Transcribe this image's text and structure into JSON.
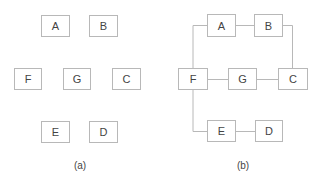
{
  "panels": [
    {
      "caption": "(a)",
      "nodes": [
        {
          "id": "A",
          "label": "A",
          "x": 41,
          "y": 15,
          "w": 29,
          "h": 22
        },
        {
          "id": "B",
          "label": "B",
          "x": 89,
          "y": 15,
          "w": 29,
          "h": 22
        },
        {
          "id": "F",
          "label": "F",
          "x": 14,
          "y": 68,
          "w": 28,
          "h": 22
        },
        {
          "id": "G",
          "label": "G",
          "x": 63,
          "y": 68,
          "w": 28,
          "h": 22
        },
        {
          "id": "C",
          "label": "C",
          "x": 112,
          "y": 68,
          "w": 29,
          "h": 22
        },
        {
          "id": "E",
          "label": "E",
          "x": 41,
          "y": 121,
          "w": 29,
          "h": 22
        },
        {
          "id": "D",
          "label": "D",
          "x": 89,
          "y": 121,
          "w": 29,
          "h": 22
        }
      ],
      "edges": []
    },
    {
      "caption": "(b)",
      "nodes": [
        {
          "id": "A",
          "label": "A",
          "x": 207,
          "y": 14,
          "w": 29,
          "h": 23
        },
        {
          "id": "B",
          "label": "B",
          "x": 254,
          "y": 14,
          "w": 29,
          "h": 23
        },
        {
          "id": "F",
          "label": "F",
          "x": 178,
          "y": 68,
          "w": 30,
          "h": 22
        },
        {
          "id": "G",
          "label": "G",
          "x": 228,
          "y": 68,
          "w": 29,
          "h": 22
        },
        {
          "id": "C",
          "label": "C",
          "x": 278,
          "y": 68,
          "w": 30,
          "h": 22
        },
        {
          "id": "E",
          "label": "E",
          "x": 207,
          "y": 120,
          "w": 29,
          "h": 22
        },
        {
          "id": "D",
          "label": "D",
          "x": 255,
          "y": 120,
          "w": 28,
          "h": 22
        }
      ],
      "edges": [
        {
          "from": "F",
          "to": "A"
        },
        {
          "from": "A",
          "to": "B"
        },
        {
          "from": "B",
          "to": "C"
        },
        {
          "from": "F",
          "to": "G"
        },
        {
          "from": "G",
          "to": "C"
        },
        {
          "from": "F",
          "to": "E"
        },
        {
          "from": "E",
          "to": "D"
        }
      ]
    }
  ],
  "colors": {
    "stroke": "#b8b8b8",
    "text": "#444444",
    "background": "#ffffff"
  }
}
